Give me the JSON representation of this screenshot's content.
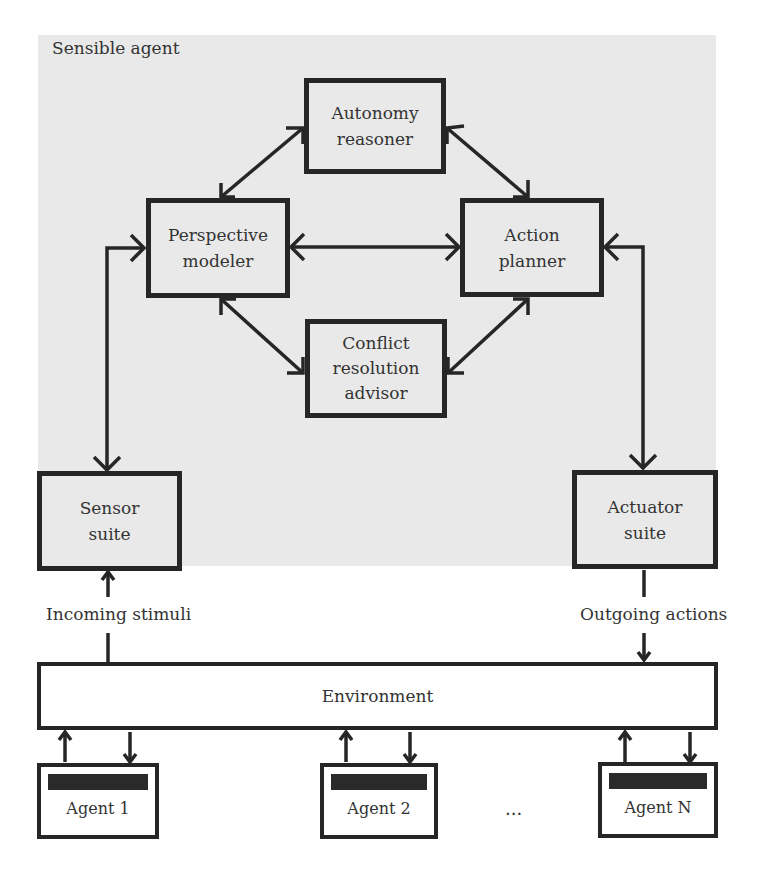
{
  "diagram": {
    "container_label": "Sensible agent",
    "components": {
      "autonomy_reasoner": "Autonomy\nreasoner",
      "perspective_modeler": "Perspective\nmodeler",
      "action_planner": "Action\nplanner",
      "conflict_resolution_advisor": "Conflict\nresolution\nadvisor",
      "sensor_suite": "Sensor\nsuite",
      "actuator_suite": "Actuator\nsuite"
    },
    "flows": {
      "incoming": "Incoming stimuli",
      "outgoing": "Outgoing actions"
    },
    "environment": "Environment",
    "agents": [
      {
        "label": "Agent 1"
      },
      {
        "label": "Agent 2"
      },
      {
        "label": "Agent N"
      }
    ],
    "ellipsis": "...",
    "colors": {
      "panel_bg": "#e9e9e9",
      "stroke": "#262626",
      "text": "#333333"
    },
    "edges": [
      {
        "from": "Perspective modeler",
        "to": "Autonomy reasoner",
        "type": "bidirectional"
      },
      {
        "from": "Autonomy reasoner",
        "to": "Action planner",
        "type": "bidirectional"
      },
      {
        "from": "Perspective modeler",
        "to": "Action planner",
        "type": "bidirectional"
      },
      {
        "from": "Perspective modeler",
        "to": "Conflict resolution advisor",
        "type": "bidirectional"
      },
      {
        "from": "Conflict resolution advisor",
        "to": "Action planner",
        "type": "bidirectional"
      },
      {
        "from": "Sensor suite",
        "to": "Perspective modeler",
        "type": "bidirectional"
      },
      {
        "from": "Action planner",
        "to": "Actuator suite",
        "type": "bidirectional"
      },
      {
        "from": "Environment",
        "to": "Sensor suite",
        "type": "directed",
        "label": "Incoming stimuli"
      },
      {
        "from": "Actuator suite",
        "to": "Environment",
        "type": "directed",
        "label": "Outgoing actions"
      },
      {
        "from": "Agent 1",
        "to": "Environment",
        "type": "directed"
      },
      {
        "from": "Environment",
        "to": "Agent 1",
        "type": "directed"
      },
      {
        "from": "Agent 2",
        "to": "Environment",
        "type": "directed"
      },
      {
        "from": "Environment",
        "to": "Agent 2",
        "type": "directed"
      },
      {
        "from": "Agent N",
        "to": "Environment",
        "type": "directed"
      },
      {
        "from": "Environment",
        "to": "Agent N",
        "type": "directed"
      }
    ]
  }
}
